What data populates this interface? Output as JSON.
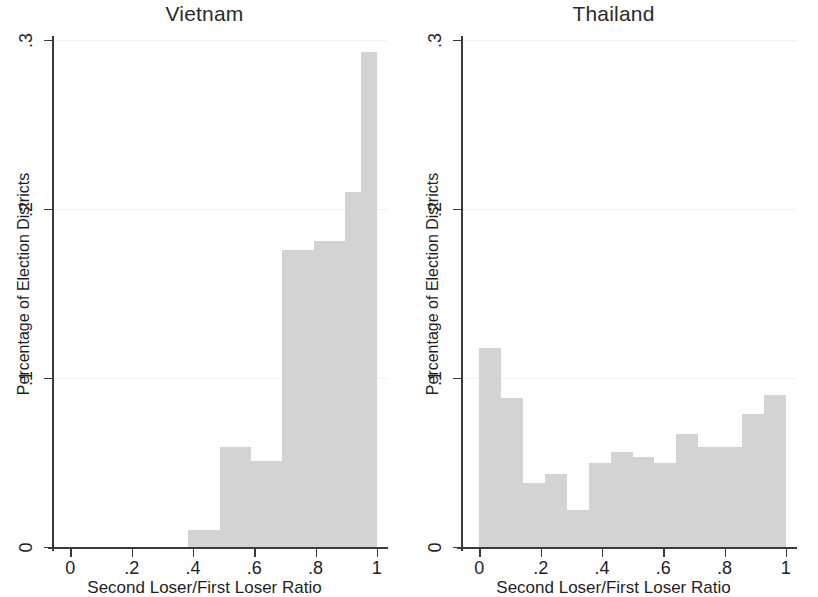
{
  "figure": {
    "axis_x_title": "Second Loser/First Loser Ratio",
    "axis_y_title": "Percentage of Election Districts",
    "bar_color": "#d3d3d3",
    "axis_color": "#3a3a3a",
    "grid_color": "#f1f1f1"
  },
  "panels": [
    {
      "title": "Vietnam"
    },
    {
      "title": "Thailand"
    }
  ],
  "ticks": {
    "y": [
      "0",
      ".1",
      ".2",
      ".3"
    ],
    "y_values": [
      0,
      0.1,
      0.2,
      0.3
    ],
    "x": [
      "0",
      ".2",
      ".4",
      ".6",
      ".8",
      "1"
    ],
    "x_values": [
      0,
      0.2,
      0.4,
      0.6,
      0.8,
      1
    ]
  },
  "chart_data": [
    {
      "type": "bar",
      "title": "Vietnam",
      "xlabel": "Second Loser/First Loser Ratio",
      "ylabel": "Percentage of Election Districts",
      "xlim": [
        -0.06,
        1.03
      ],
      "ylim": [
        0,
        0.3
      ],
      "grid": true,
      "legend": "none",
      "bin_edges": [
        0.385,
        0.487,
        0.589,
        0.692,
        0.794,
        0.897,
        1.0
      ],
      "categories": [
        "0.385-0.487",
        "0.487-0.589",
        "0.589-0.692",
        "0.692-0.794",
        "0.794-0.897",
        "0.897-1.0"
      ],
      "values": [
        0.01,
        0.059,
        0.051,
        0.176,
        0.181,
        0.21
      ]
    },
    {
      "type": "bar",
      "title": "Vietnam-tall-bin",
      "note": "final bin",
      "xlabel": "Second Loser/First Loser Ratio",
      "ylabel": "Percentage of Election Districts",
      "xlim": [
        -0.06,
        1.03
      ],
      "ylim": [
        0,
        0.3
      ],
      "grid": true,
      "legend": "none",
      "bin_edges": [
        0.95,
        1.0
      ],
      "categories": [
        "0.95-1.0"
      ],
      "values": [
        0.293
      ]
    },
    {
      "type": "bar",
      "title": "Thailand",
      "xlabel": "Second Loser/First Loser Ratio",
      "ylabel": "Percentage of Election Districts",
      "xlim": [
        -0.06,
        1.03
      ],
      "ylim": [
        0,
        0.3
      ],
      "grid": true,
      "legend": "none",
      "bin_edges": [
        0.0,
        0.071,
        0.143,
        0.214,
        0.286,
        0.357,
        0.429,
        0.5,
        0.571,
        0.643,
        0.714,
        0.786,
        0.857,
        0.929,
        1.0
      ],
      "categories": [
        "0-.071",
        ".071-.143",
        ".143-.214",
        ".214-.286",
        ".286-.357",
        ".357-.429",
        ".429-.5",
        ".5-.571",
        ".571-.643",
        ".643-.714",
        ".714-.786",
        ".786-.857",
        ".857-.929",
        ".929-1"
      ],
      "values": [
        0.118,
        0.088,
        0.038,
        0.043,
        0.022,
        0.05,
        0.056,
        0.053,
        0.05,
        0.067,
        0.059,
        0.059,
        0.079,
        0.09
      ]
    }
  ]
}
